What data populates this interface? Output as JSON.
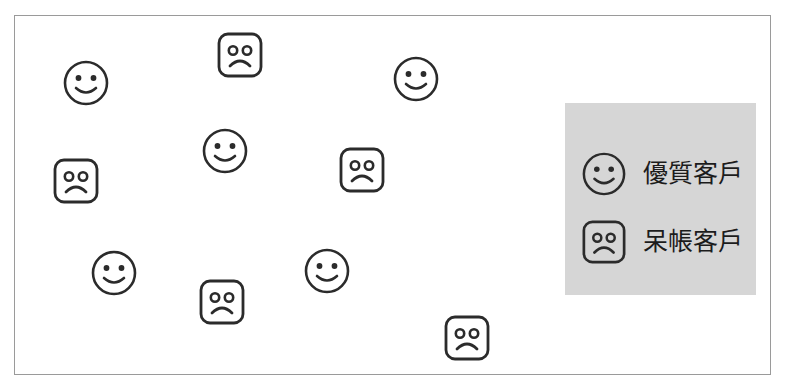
{
  "figure": {
    "background_color": "#ffffff",
    "frame": {
      "border_color": "#9a9a9a",
      "background_color": "#ffffff"
    }
  },
  "markers": {
    "good_customer_icon": "smiley-face-round-icon",
    "bad_debt_customer_icon": "sad-face-square-icon",
    "stroke_color": "#2b2b2b",
    "fill_color": "#ffffff"
  },
  "scatter": {
    "points": [
      {
        "type": "good",
        "name": "smiley-face-1",
        "cx": 71,
        "cy": 67,
        "r": 24
      },
      {
        "type": "bad",
        "name": "sad-face-1",
        "cx": 225,
        "cy": 39,
        "r": 24
      },
      {
        "type": "good",
        "name": "smiley-face-2",
        "cx": 401,
        "cy": 63,
        "r": 24
      },
      {
        "type": "good",
        "name": "smiley-face-3",
        "cx": 210,
        "cy": 135,
        "r": 24
      },
      {
        "type": "bad",
        "name": "sad-face-2",
        "cx": 347,
        "cy": 154,
        "r": 24
      },
      {
        "type": "bad",
        "name": "sad-face-3",
        "cx": 61,
        "cy": 165,
        "r": 24
      },
      {
        "type": "good",
        "name": "smiley-face-4",
        "cx": 99,
        "cy": 257,
        "r": 24
      },
      {
        "type": "bad",
        "name": "sad-face-4",
        "cx": 207,
        "cy": 286,
        "r": 24
      },
      {
        "type": "good",
        "name": "smiley-face-5",
        "cx": 312,
        "cy": 255,
        "r": 24
      },
      {
        "type": "bad",
        "name": "sad-face-5",
        "cx": 452,
        "cy": 322,
        "r": 24
      }
    ]
  },
  "legend": {
    "background_color": "#d6d6d6",
    "items": [
      {
        "icon": "smiley-face-round-icon",
        "label": "優質客戶"
      },
      {
        "icon": "sad-face-square-icon",
        "label": "呆帳客戶"
      }
    ]
  }
}
